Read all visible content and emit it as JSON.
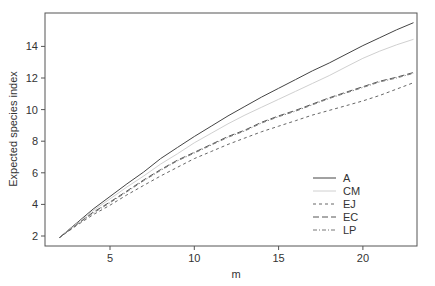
{
  "chart_data": {
    "type": "line",
    "title": "",
    "xlabel": "m",
    "ylabel": "Expected species index",
    "xlim": [
      1.3,
      23.5
    ],
    "ylim": [
      1.4,
      15.9
    ],
    "xticks": [
      5,
      10,
      15,
      20
    ],
    "yticks": [
      2,
      4,
      6,
      8,
      10,
      12,
      14
    ],
    "grid": false,
    "legend_position": "lower right",
    "x": [
      2,
      3,
      4,
      5,
      6,
      7,
      8,
      9,
      10,
      11,
      12,
      13,
      14,
      15,
      16,
      17,
      18,
      19,
      20,
      21,
      22,
      23
    ],
    "series": [
      {
        "name": "A",
        "style": "solid",
        "color": "#444444",
        "values": [
          1.9,
          2.8,
          3.7,
          4.5,
          5.3,
          6.05,
          6.9,
          7.6,
          8.3,
          8.95,
          9.6,
          10.2,
          10.8,
          11.35,
          11.9,
          12.45,
          12.95,
          13.5,
          14.05,
          14.55,
          15.05,
          15.5
        ]
      },
      {
        "name": "CM",
        "style": "solid",
        "color": "#d0d0d0",
        "values": [
          1.9,
          2.75,
          3.6,
          4.35,
          5.1,
          5.8,
          6.55,
          7.2,
          7.9,
          8.5,
          9.1,
          9.65,
          10.15,
          10.65,
          11.15,
          11.65,
          12.15,
          12.7,
          13.25,
          13.7,
          14.1,
          14.45
        ]
      },
      {
        "name": "EJ",
        "style": "dashed",
        "color": "#666666",
        "values": [
          1.9,
          2.65,
          3.35,
          3.95,
          4.6,
          5.2,
          5.8,
          6.35,
          6.9,
          7.35,
          7.8,
          8.2,
          8.6,
          8.95,
          9.3,
          9.65,
          9.95,
          10.25,
          10.55,
          10.9,
          11.3,
          11.7
        ]
      },
      {
        "name": "EC",
        "style": "longdash",
        "color": "#555555",
        "values": [
          1.9,
          2.7,
          3.5,
          4.15,
          4.85,
          5.55,
          6.2,
          6.8,
          7.3,
          7.8,
          8.3,
          8.7,
          9.2,
          9.6,
          9.95,
          10.35,
          10.75,
          11.1,
          11.45,
          11.8,
          12.05,
          12.35
        ]
      },
      {
        "name": "LP",
        "style": "dotdash",
        "color": "#777777",
        "values": [
          1.9,
          2.7,
          3.45,
          4.1,
          4.8,
          5.5,
          6.15,
          6.75,
          7.25,
          7.75,
          8.25,
          8.65,
          9.15,
          9.55,
          9.9,
          10.3,
          10.7,
          11.05,
          11.4,
          11.75,
          12.0,
          12.3
        ]
      }
    ]
  }
}
